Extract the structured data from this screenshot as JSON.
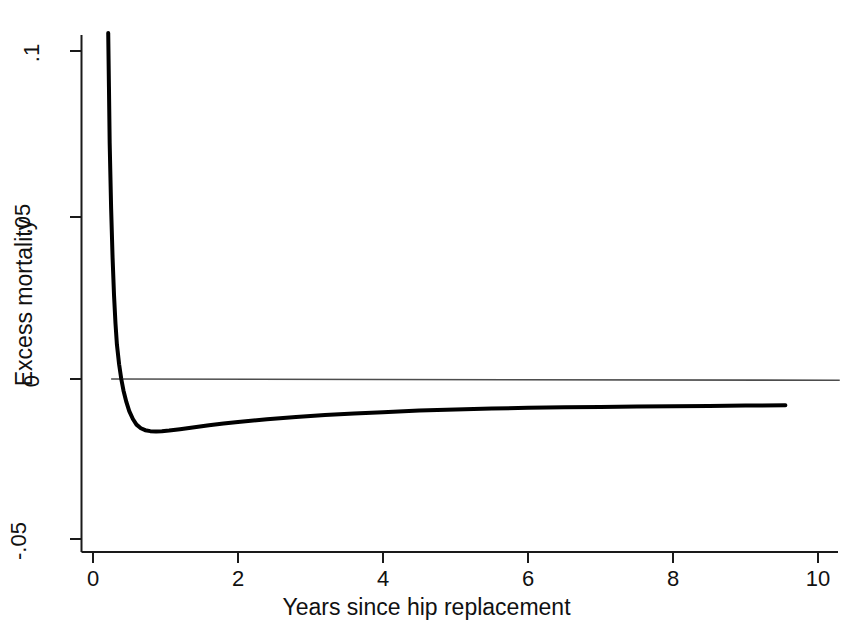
{
  "figure": {
    "background_color": "#ffffff",
    "ink_color": "#000000",
    "reference_line_color": "#4d4d4d"
  },
  "axes": {
    "x": {
      "title": "Years since hip replacement",
      "tick_labels": [
        "0",
        "2",
        "4",
        "6",
        "8",
        "10"
      ],
      "tick_values": [
        0,
        2,
        4,
        6,
        8,
        10
      ],
      "range": [
        0,
        10.35
      ]
    },
    "y": {
      "title": "Excess mortality",
      "tick_labels": [
        "-.05",
        "0",
        ".05",
        ".1"
      ],
      "tick_values": [
        -0.05,
        0,
        0.05,
        0.1
      ],
      "range": [
        -0.0535,
        0.1095
      ]
    }
  },
  "chart_data": {
    "type": "line",
    "title": "",
    "xlabel": "Years since hip replacement",
    "ylabel": "Excess mortality",
    "xlim": [
      0,
      10.35
    ],
    "ylim": [
      -0.0535,
      0.1095
    ],
    "xticks": [
      0,
      2,
      4,
      6,
      8,
      10
    ],
    "xticklabels": [
      "0",
      "2",
      "4",
      "6",
      "8",
      "10"
    ],
    "yticks": [
      -0.05,
      0,
      0.05,
      0.1
    ],
    "yticklabels": [
      "-.05",
      "0",
      ".05",
      ".1"
    ],
    "grid": false,
    "legend": null,
    "annotations": [],
    "series": [
      {
        "name": "Excess mortality",
        "style": "solid",
        "color": "#000000",
        "line_width": 4,
        "x": [
          0.21,
          0.22,
          0.23,
          0.25,
          0.27,
          0.29,
          0.31,
          0.33,
          0.36,
          0.39,
          0.42,
          0.46,
          0.5,
          0.55,
          0.6,
          0.66,
          0.72,
          0.79,
          0.87,
          0.95,
          1.05,
          1.2,
          1.4,
          1.6,
          1.8,
          2.0,
          2.4,
          2.8,
          3.2,
          3.6,
          4.0,
          4.5,
          5.0,
          5.5,
          6.0,
          6.5,
          7.0,
          7.5,
          8.0,
          8.5,
          9.0,
          9.55
        ],
        "y": [
          0.1055,
          0.089,
          0.072,
          0.052,
          0.037,
          0.0255,
          0.017,
          0.0105,
          0.0045,
          0.0,
          -0.0035,
          -0.007,
          -0.0098,
          -0.0122,
          -0.0139,
          -0.015,
          -0.0156,
          -0.0159,
          -0.016,
          -0.0159,
          -0.0157,
          -0.0153,
          -0.0147,
          -0.0141,
          -0.0136,
          -0.0131,
          -0.0123,
          -0.0116,
          -0.011,
          -0.0105,
          -0.0101,
          -0.0096,
          -0.0093,
          -0.009,
          -0.0088,
          -0.0086,
          -0.0085,
          -0.0084,
          -0.0083,
          -0.0082,
          -0.0081,
          -0.008
        ]
      },
      {
        "name": "zero reference line",
        "style": "solid",
        "color": "#4d4d4d",
        "line_width": 1,
        "x": [
          0.25,
          10.3
        ],
        "y": [
          0.0,
          -0.0004
        ]
      }
    ]
  }
}
